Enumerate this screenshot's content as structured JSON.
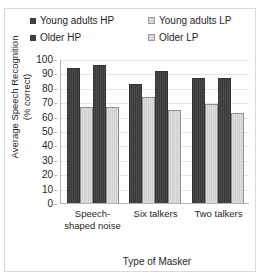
{
  "chart_data": {
    "type": "bar",
    "title": "",
    "categories": [
      "Speech-shaped noise",
      "Six talkers",
      "Two talkers"
    ],
    "series": [
      {
        "name": "Young adults HP",
        "values": [
          93,
          82,
          86
        ],
        "color": "#424242",
        "swatch": "dark"
      },
      {
        "name": "Young adults LP",
        "values": [
          66,
          73,
          68
        ],
        "color": "#d8d8d8",
        "swatch": "light"
      },
      {
        "name": "Older HP",
        "values": [
          95,
          91,
          86
        ],
        "color": "#424242",
        "swatch": "dark"
      },
      {
        "name": "Older LP",
        "values": [
          66,
          64,
          62
        ],
        "color": "#d8d8d8",
        "swatch": "light"
      }
    ],
    "xlabel": "Type of Masker",
    "ylabel": "Average Speech Recognition\n(% correct)",
    "ylabel_line1": "Average Speech Recognition",
    "ylabel_line2": "(% correct)",
    "ylim": [
      0,
      100
    ],
    "ytick_step": 10,
    "yticks": [
      100,
      90,
      80,
      70,
      60,
      50,
      40,
      30,
      20,
      10,
      0
    ],
    "grid": true,
    "legend_position": "top"
  },
  "legend": {
    "entries": [
      {
        "label": "Young adults HP"
      },
      {
        "label": "Young adults LP"
      },
      {
        "label": "Older HP"
      },
      {
        "label": "Older LP"
      }
    ]
  },
  "axes": {
    "y_title_line1": "Average Speech Recognition",
    "y_title_line2": "(% correct)",
    "x_title": "Type of Masker"
  }
}
